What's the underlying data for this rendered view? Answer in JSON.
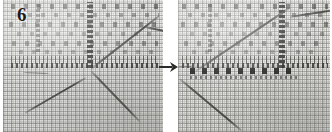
{
  "figure": {
    "label": "6",
    "kind": "photographic-step-figure",
    "panel_count": 2,
    "background_color": "#ffffff",
    "cloth_color": "#ececea",
    "thread_color": "#3a3a37",
    "stitch_color": "#1c1c1a"
  },
  "panels": {
    "before": {
      "name": "before",
      "label": "6",
      "alt": "Even-weave canvas with a dark vertical stitch column, a horizontal band of dark stitches and the working thread looping down to the lower left."
    },
    "after": {
      "name": "after",
      "label": "",
      "alt": "The same canvas after the step: a new row of discrete dark stitches has been worked below the horizontal band and the thread is drawn up to the upper right."
    }
  },
  "arrow": {
    "icon": "arrow-right-icon",
    "glyph": "→",
    "meaning": "proceeds to",
    "color": "#2b2b28"
  }
}
